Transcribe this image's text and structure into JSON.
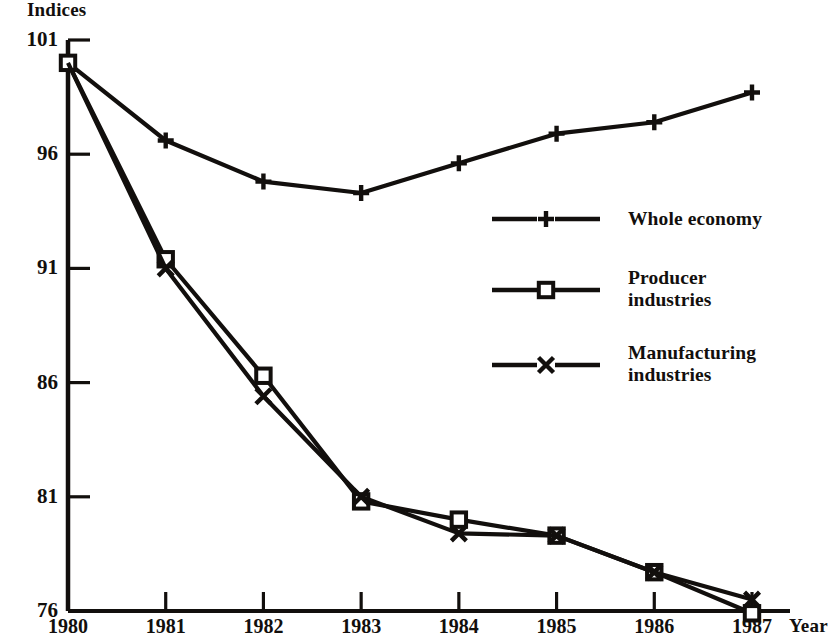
{
  "chart_data": {
    "type": "line",
    "title": "",
    "xlabel": "Year",
    "ylabel": "Indices",
    "categories": [
      "1980",
      "1981",
      "1982",
      "1983",
      "1984",
      "1985",
      "1986",
      "1987"
    ],
    "x": [
      1980,
      1981,
      1982,
      1983,
      1984,
      1985,
      1986,
      1987
    ],
    "xlim": [
      1980,
      1987
    ],
    "ylim": [
      76,
      101
    ],
    "yticks": [
      101,
      96,
      91,
      86,
      81,
      76
    ],
    "xticks": [
      "1980",
      "1981",
      "1982",
      "1983",
      "1984",
      "1985",
      "1986",
      "1987"
    ],
    "grid": false,
    "legend_position": "right-middle",
    "series": [
      {
        "name": "Whole economy",
        "marker": "plus",
        "values": [
          100.0,
          96.6,
          94.8,
          94.3,
          95.6,
          96.9,
          97.4,
          98.7
        ]
      },
      {
        "name": "Producer industries",
        "marker": "square",
        "values": [
          100.0,
          91.4,
          86.3,
          80.8,
          80.0,
          79.3,
          77.7,
          75.9
        ]
      },
      {
        "name": "Manufacturing industries",
        "marker": "cross",
        "values": [
          100.0,
          91.0,
          85.4,
          81.0,
          79.4,
          79.3,
          77.7,
          76.5
        ]
      }
    ]
  },
  "axes": {
    "y_axis_title": "Indices",
    "x_axis_title": "Year",
    "y_tick_labels": [
      "101",
      "96",
      "91",
      "86",
      "81",
      "76"
    ],
    "x_tick_labels": [
      "1980",
      "1981",
      "1982",
      "1983",
      "1984",
      "1985",
      "1986",
      "1987"
    ]
  },
  "legend": {
    "items": [
      {
        "label": "Whole economy",
        "marker": "plus-marker"
      },
      {
        "label": "Producer\nindustries",
        "marker": "square-marker"
      },
      {
        "label": "Manufacturing\nindustries",
        "marker": "cross-marker"
      }
    ]
  },
  "style": {
    "ink": "#120f0d",
    "background": "#ffffff"
  }
}
